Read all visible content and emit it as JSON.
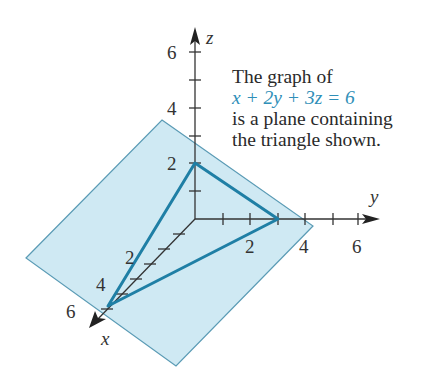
{
  "caption": {
    "line1": "The graph of",
    "equation": "x + 2y + 3z = 6",
    "line3": "is a plane containing",
    "line4": "the triangle shown."
  },
  "axes": {
    "x_label": "x",
    "y_label": "y",
    "z_label": "z",
    "x_ticks": [
      "2",
      "4",
      "6"
    ],
    "y_ticks": [
      "2",
      "4",
      "6"
    ],
    "z_ticks": [
      "2",
      "4",
      "6"
    ]
  },
  "triangle": {
    "vertices": [
      {
        "name": "x-intercept",
        "coords": [
          6,
          0,
          0
        ]
      },
      {
        "name": "y-intercept",
        "coords": [
          0,
          3,
          0
        ]
      },
      {
        "name": "z-intercept",
        "coords": [
          0,
          0,
          2
        ]
      }
    ]
  },
  "colors": {
    "plane_fill": "#cfe9f3",
    "plane_edge": "#5a9bb5",
    "triangle_edge": "#1f7fa5",
    "equation_text": "#2f8fb8",
    "axis": "#333333"
  }
}
